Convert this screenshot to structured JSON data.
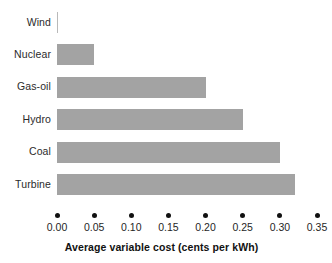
{
  "chart_data": {
    "type": "bar",
    "orientation": "horizontal",
    "title": "",
    "xlabel": "Average variable cost (cents per kWh)",
    "ylabel": "",
    "categories": [
      "Wind",
      "Nuclear",
      "Gas-oil",
      "Hydro",
      "Coal",
      "Turbine"
    ],
    "values": [
      0.0,
      0.05,
      0.2,
      0.25,
      0.3,
      0.32
    ],
    "xlim": [
      0.0,
      0.35
    ],
    "xticks": [
      0.0,
      0.05,
      0.1,
      0.15,
      0.2,
      0.25,
      0.3,
      0.35
    ],
    "xticklabels": [
      "0.00",
      "0.05",
      "0.10",
      "0.15",
      "0.20",
      "0.25",
      "0.30",
      "0.35"
    ],
    "grid": false,
    "legend": null,
    "series": [
      {
        "name": "Average variable cost",
        "values": [
          0.0,
          0.05,
          0.2,
          0.25,
          0.3,
          0.32
        ]
      }
    ]
  },
  "style": {
    "bar_color": "#a3a3a3",
    "tick_color": "#111111",
    "text_color": "#1f1f1f",
    "background": "#ffffff"
  }
}
